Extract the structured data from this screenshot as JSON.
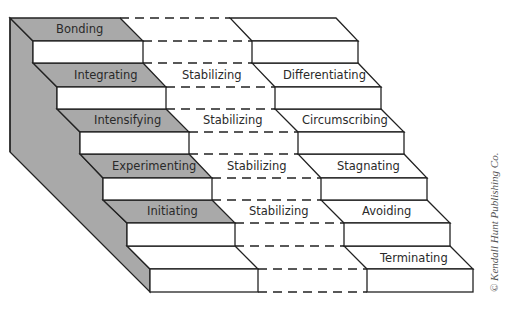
{
  "diagram": {
    "coming_together": [
      {
        "label": "Bonding"
      },
      {
        "label": "Integrating"
      },
      {
        "label": "Intensifying"
      },
      {
        "label": "Experimenting"
      },
      {
        "label": "Initiating"
      }
    ],
    "middle": [
      {
        "label": ""
      },
      {
        "label": "Stabilizing"
      },
      {
        "label": "Stabilizing"
      },
      {
        "label": "Stabilizing"
      },
      {
        "label": "Stabilizing"
      }
    ],
    "coming_apart": [
      {
        "label": ""
      },
      {
        "label": "Differentiating"
      },
      {
        "label": "Circumscribing"
      },
      {
        "label": "Stagnating"
      },
      {
        "label": "Avoiding"
      },
      {
        "label": "Terminating"
      }
    ],
    "copyright": "© Kendall Hunt Publishing Co.",
    "colors": {
      "shade": "#a9a9a9",
      "line": "#222222",
      "face": "#ffffff"
    }
  }
}
